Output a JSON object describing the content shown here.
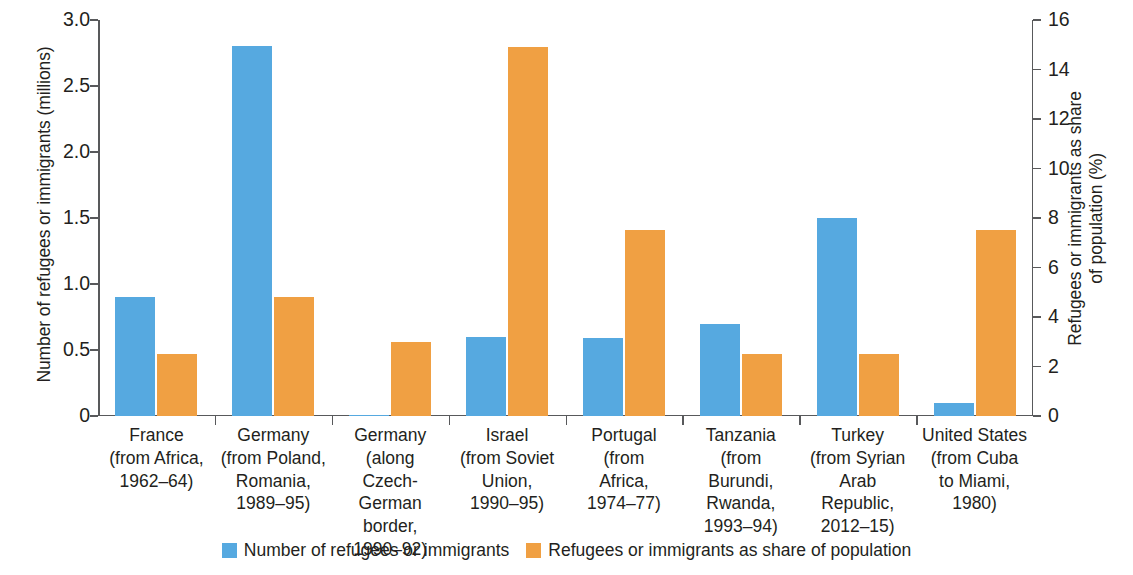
{
  "chart_data": {
    "type": "bar",
    "title": "",
    "subtitle": "",
    "categories": [
      "France\n(from Africa,\n1962–64)",
      "Germany\n(from Poland,\nRomania,\n1989–95)",
      "Germany\n(along\nCzech-German\nborder,\n1990–92)",
      "Israel\n(from Soviet\nUnion,\n1990–95)",
      "Portugal\n(from\nAfrica,\n1974–77)",
      "Tanzania\n(from\nBurundi,\nRwanda,\n1993–94)",
      "Turkey\n(from Syrian\nArab\nRepublic,\n2012–15)",
      "United States\n(from Cuba\nto Miami,\n1980)"
    ],
    "category_lines": [
      [
        "France",
        "(from Africa,",
        "1962–64)"
      ],
      [
        "Germany",
        "(from Poland,",
        "Romania,",
        "1989–95)"
      ],
      [
        "Germany",
        "(along",
        "Czech-German",
        "border,",
        "1990–92)"
      ],
      [
        "Israel",
        "(from Soviet",
        "Union,",
        "1990–95)"
      ],
      [
        "Portugal",
        "(from",
        "Africa,",
        "1974–77)"
      ],
      [
        "Tanzania",
        "(from",
        "Burundi,",
        "Rwanda,",
        "1993–94)"
      ],
      [
        "Turkey",
        "(from Syrian",
        "Arab",
        "Republic,",
        "2012–15)"
      ],
      [
        "United States",
        "(from Cuba",
        "to Miami,",
        "1980)"
      ]
    ],
    "series": [
      {
        "name": "Number of refugees or immigrants",
        "axis": "left",
        "unit": "millions",
        "color": "#56a9e0",
        "values": [
          0.9,
          2.8,
          0.01,
          0.6,
          0.59,
          0.7,
          1.5,
          0.1
        ]
      },
      {
        "name": "Refugees or immigrants as share of population",
        "axis": "right",
        "unit": "%",
        "color": "#f0a043",
        "values": [
          2.5,
          4.8,
          3.0,
          14.9,
          7.5,
          2.5,
          2.5,
          7.5
        ]
      }
    ],
    "xlabel": "",
    "ylabel_left": "Number of refugees or immigrants (millions)",
    "ylabel_right": "Refugees or immigrants as share\nof population (%)",
    "ylabel_right_lines": [
      "Refugees or immigrants as share",
      "of population (%)"
    ],
    "ylim_left": [
      0,
      3.0
    ],
    "ylim_right": [
      0,
      16
    ],
    "yticks_left": [
      "0",
      "0.5",
      "1.0",
      "1.5",
      "2.0",
      "2.5",
      "3.0"
    ],
    "ytick_values_left": [
      0,
      0.5,
      1.0,
      1.5,
      2.0,
      2.5,
      3.0
    ],
    "yticks_right": [
      "0",
      "2",
      "4",
      "6",
      "8",
      "10",
      "12",
      "14",
      "16"
    ],
    "ytick_values_right": [
      0,
      2,
      4,
      6,
      8,
      10,
      12,
      14,
      16
    ],
    "grid": false,
    "legend_position": "bottom-center",
    "legend": [
      {
        "label": "Number of refugees or immigrants",
        "color": "#56a9e0"
      },
      {
        "label": "Refugees or immigrants as share of population",
        "color": "#f0a043"
      }
    ],
    "background_color": "#ffffff",
    "axis_color": "#58595b"
  }
}
